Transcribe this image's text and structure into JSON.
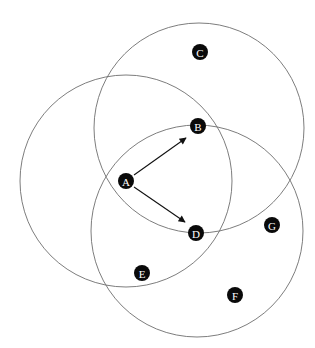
{
  "diagram": {
    "type": "wireless-network-transmission-ranges",
    "range_circles": [
      {
        "id": "range-A",
        "center_node": "A",
        "cx": 126,
        "cy": 181,
        "r": 106
      },
      {
        "id": "range-B",
        "center_node": "B",
        "cx": 199,
        "cy": 128,
        "r": 105
      },
      {
        "id": "range-D",
        "center_node": "D",
        "cx": 197,
        "cy": 231,
        "r": 106
      }
    ],
    "nodes": [
      {
        "label": "A",
        "x": 126,
        "y": 181
      },
      {
        "label": "B",
        "x": 198,
        "y": 126
      },
      {
        "label": "C",
        "x": 200,
        "y": 52
      },
      {
        "label": "D",
        "x": 196,
        "y": 233
      },
      {
        "label": "E",
        "x": 142,
        "y": 273
      },
      {
        "label": "F",
        "x": 235,
        "y": 295
      },
      {
        "label": "G",
        "x": 272,
        "y": 225
      }
    ],
    "edges": [
      {
        "from": "A",
        "to": "B",
        "x1": 134,
        "y1": 175,
        "x2": 186,
        "y2": 138
      },
      {
        "from": "A",
        "to": "D",
        "x1": 134,
        "y1": 187,
        "x2": 185,
        "y2": 222
      }
    ],
    "node_radius": 8,
    "colors": {
      "node_fill": "#0a0a0a",
      "node_text": "#ffffff",
      "circle_stroke": "#6e6e6e",
      "arrow": "#111111"
    }
  }
}
